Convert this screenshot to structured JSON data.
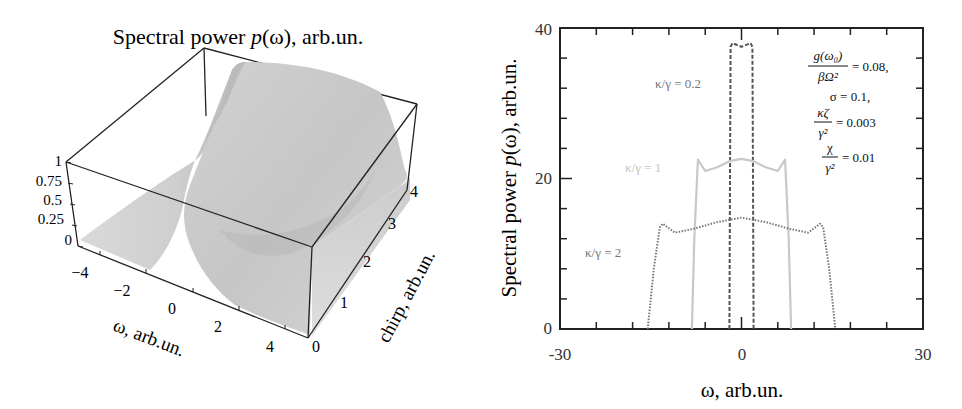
{
  "chart_data": [
    {
      "type": "surface3d",
      "title": "Spectral power p(ω), arb.un.",
      "title_parts": {
        "prefix": "Spectral power ",
        "italic": "p",
        "suffix": "(ω), arb.un."
      },
      "xlabel": "ω, arb.un.",
      "ylabel": "chirp, arb.un.",
      "zlabel": "",
      "x_ticks": [
        "−4",
        "−2",
        "0",
        "2",
        "4"
      ],
      "y_ticks": [
        "0",
        "1",
        "2",
        "3",
        "4"
      ],
      "z_ticks": [
        "0",
        "0.25",
        "0.5",
        "0.75",
        "1"
      ],
      "xlim": [
        -5,
        5
      ],
      "ylim": [
        0,
        4
      ],
      "zlim": [
        0,
        1
      ],
      "description": "Gaussian-like spectral ridge near ω≈0 at chirp=0 that broadens into a plateau of height ~1 as chirp increases to 4; grayscale shading, bounding box drawn."
    },
    {
      "type": "line",
      "title": "",
      "xlabel": "ω, arb.un.",
      "ylabel": "Spectral power p(ω), arb.un.",
      "ylabel_parts": {
        "prefix": "Spectral power ",
        "italic": "p",
        "suffix": "(ω), arb.un."
      },
      "xlim": [
        -30,
        30
      ],
      "ylim": [
        0,
        40
      ],
      "x_tick_labels": [
        "-30",
        "0",
        "30"
      ],
      "y_tick_labels": [
        "0",
        "20",
        "40"
      ],
      "grid": false,
      "series": [
        {
          "name": "κ/γ = 0.2",
          "style": "dashed",
          "color": "#555555",
          "x": [
            -2.0,
            -1.9,
            -1.8,
            -1.5,
            0,
            1.5,
            1.8,
            1.9,
            2.0
          ],
          "y": [
            0,
            20,
            37.5,
            38,
            37.5,
            38,
            37.5,
            20,
            0
          ]
        },
        {
          "name": "κ/γ = 1",
          "style": "solid",
          "color": "#c8c8c8",
          "x": [
            -8.2,
            -7.8,
            -7.2,
            -6,
            -4,
            -2,
            0,
            2,
            4,
            6,
            7.2,
            7.8,
            8.2
          ],
          "y": [
            0,
            12,
            22.5,
            21,
            21.5,
            22.3,
            22.6,
            22.3,
            21.5,
            21,
            22.5,
            12,
            0
          ]
        },
        {
          "name": "κ/γ = 2",
          "style": "dotted",
          "color": "#777777",
          "x": [
            -15.5,
            -14.5,
            -13.5,
            -13,
            -11,
            -8,
            -4,
            0,
            4,
            8,
            11,
            13,
            13.5,
            14.5,
            15.5
          ],
          "y": [
            0,
            8,
            13.5,
            14,
            12.8,
            13.3,
            14.2,
            14.8,
            14.2,
            13.3,
            12.8,
            14,
            13.5,
            8,
            0
          ]
        }
      ],
      "annotations": [
        {
          "text": "g(ω₀)/βΩ² = 0.08,",
          "numerator": "g(ω₀)",
          "denominator": "βΩ²",
          "value": "= 0.08,"
        },
        {
          "text": "σ = 0.1,"
        },
        {
          "text": "κζ/γ² = 0.003",
          "numerator": "κζ",
          "denominator": "γ²",
          "value": "= 0.003"
        },
        {
          "text": "χ/γ² = 0.01",
          "numerator": "χ",
          "denominator": "γ²",
          "value": "= 0.01"
        }
      ],
      "series_labels": [
        {
          "text": "κ/γ = 0.2",
          "color": "#777777"
        },
        {
          "text": "κ/γ = 1",
          "color": "#c4c4c4"
        },
        {
          "text": "κ/γ = 2",
          "color": "#777777"
        }
      ]
    }
  ]
}
